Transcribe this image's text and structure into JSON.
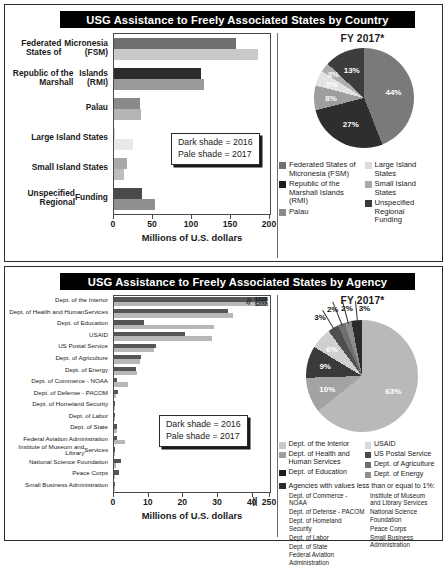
{
  "colors": {
    "dark_fsm": "#6f6f6f",
    "pale_fsm": "#c9c9c9",
    "dark_rmi": "#2b2b2b",
    "pale_rmi": "#9a9a9a",
    "dark_palau": "#8a8a8a",
    "pale_palau": "#b5b5b5",
    "dark_large": "#d5d5d5",
    "pale_large": "#e8e8e8",
    "dark_small": "#a9a9a9",
    "pale_small": "#bdbdbd",
    "dark_unspec": "#4a4a4a",
    "pale_unspec": "#8f8f8f",
    "title_bar_bg": "#000000",
    "title_bar_fg": "#ffffff",
    "panel_border": "#2b2b2b"
  },
  "country_panel": {
    "title": "USG Assistance to Freely Associated States by Country",
    "shade_key": {
      "dark_line": "Dark shade = 2016",
      "pale_line": "Pale shade = 2017"
    },
    "pie_title": "FY 2017*",
    "legend_left": [
      {
        "label": "Federated States of Micronesia (FSM)",
        "color": "#6f6f6f"
      },
      {
        "label": "Republic of the Marshall Islands (RMI)",
        "color": "#1f1f1f"
      },
      {
        "label": "Palau",
        "color": "#8a8a8a"
      }
    ],
    "legend_right": [
      {
        "label": "Large Island States",
        "color": "#dcdcdc"
      },
      {
        "label": "Small Island States",
        "color": "#a9a9a9"
      },
      {
        "label": "Unspecified Regional Funding",
        "color": "#3a3a3a"
      }
    ]
  },
  "agency_panel": {
    "title": "USG Assistance to Freely Associated States by Agency",
    "shade_key": {
      "dark_line": "Dark shade = 2016",
      "pale_line": "Pale shade = 2017"
    },
    "pie_title": "FY 2017*",
    "bar_value_notes": [
      "$203B",
      "$206B"
    ],
    "legend_left": [
      {
        "label": "Dept. of the Interior",
        "color": "#c9c9c9"
      },
      {
        "label": "Dept. of Health and Human Services",
        "color": "#9e9e9e"
      },
      {
        "label": "Dept. of Education",
        "color": "#1f1f1f"
      }
    ],
    "legend_right": [
      {
        "label": "USAID",
        "color": "#d8d8d8"
      },
      {
        "label": "US Postal Service",
        "color": "#4a4a4a"
      },
      {
        "label": "Dept. of Agriculture",
        "color": "#6f6f6f"
      },
      {
        "label": "Dept. of Energy",
        "color": "#8f8f8f"
      }
    ],
    "legend_note": {
      "label": "Agencies with values less than or equal to 1%:",
      "color": "#2b2b2b"
    },
    "sub_left": [
      "Dept. of Commerce - NOAA",
      "Dept. of Defense - PACOM",
      "Dept. of Homeland Security",
      "Dept. of Labor",
      "Dept. of State",
      "Federal Aviation Administration"
    ],
    "sub_right": [
      "Institute of Museum and Library Services",
      "National Science Foundation",
      "Peace Corps",
      "Small Business Administration"
    ]
  },
  "chart_data": [
    {
      "id": "country-bar",
      "type": "bar",
      "orientation": "horizontal",
      "title": "USG Assistance to Freely Associated States by Country",
      "xlabel": "Millions of U.S. dollars",
      "ylabel": "",
      "xlim": [
        0,
        200
      ],
      "xticks": [
        0,
        50,
        100,
        150,
        200
      ],
      "grid": false,
      "categories": [
        "Federated States of Micronesia (FSM)",
        "Republic of the Marshall Islands (RMI)",
        "Palau",
        "Large Island States",
        "Small Island States",
        "Unspecified Regional Funding"
      ],
      "series": [
        {
          "name": "2016",
          "shade": "dark",
          "values": [
            157,
            112,
            33,
            1,
            17,
            36
          ]
        },
        {
          "name": "2017",
          "shade": "pale",
          "values": [
            185,
            116,
            35,
            24,
            13,
            52
          ]
        }
      ]
    },
    {
      "id": "country-pie",
      "type": "pie",
      "title": "FY 2017*",
      "legend_position": "bottom",
      "labels": [
        "Federated States of Micronesia (FSM)",
        "Republic of the Marshall Islands (RMI)",
        "Palau",
        "Large Island States",
        "Small Island States",
        "Unspecified Regional Funding"
      ],
      "values": [
        44,
        27,
        8,
        5,
        3,
        13
      ],
      "display_labels": [
        "44%",
        "27%",
        "8%",
        "5%",
        "3%",
        "13%"
      ]
    },
    {
      "id": "agency-bar",
      "type": "bar",
      "orientation": "horizontal",
      "title": "USG Assistance to Freely Associated States by Agency",
      "xlabel": "Millions of U.S. dollars",
      "ylabel": "",
      "xlim": [
        0,
        45
      ],
      "xticks": [
        0,
        10,
        20,
        30,
        40
      ],
      "axis_break_after": 40,
      "axis_break_label": "250",
      "grid": false,
      "categories": [
        "Dept. of the Interior",
        "Dept. of Health and Human Services",
        "Dept. of Education",
        "USAID",
        "US Postal Service",
        "Dept. of Agriculture",
        "Dept. of Energy",
        "Dept. of Commerce - NOAA",
        "Dept. of Defense - PACOM",
        "Dept. of Homeland Security",
        "Dept. of Labor",
        "Dept. of State",
        "Federal Aviation Administration",
        "Institute of Museum and Library Services",
        "National Science Foundation",
        "Peace Corps",
        "Small Business Administration"
      ],
      "series": [
        {
          "name": "2016",
          "shade": "dark",
          "values": [
            44,
            33,
            8.6,
            20.5,
            12.1,
            7.8,
            6.4,
            0.9,
            1.2,
            0.4,
            0.3,
            1.0,
            0.8,
            0.4,
            1.9,
            1.5,
            0.3
          ]
        },
        {
          "name": "2017",
          "shade": "pale",
          "values": [
            44,
            34.2,
            28.8,
            28.2,
            11.4,
            7.4,
            6.6,
            4.0,
            0.5,
            0.4,
            0.3,
            0.9,
            3.1,
            0.2,
            0.5,
            0.4,
            0.2
          ]
        }
      ]
    },
    {
      "id": "agency-pie",
      "type": "pie",
      "title": "FY 2017*",
      "legend_position": "bottom",
      "labels": [
        "Dept. of the Interior",
        "Dept. of Health and Human Services",
        "Dept. of Education",
        "USAID",
        "US Postal Service",
        "Dept. of Agriculture",
        "Dept. of Energy",
        "Agencies with values less than or equal to 1%"
      ],
      "values": [
        63,
        10,
        9,
        6,
        3,
        2,
        2,
        3
      ],
      "display_labels": [
        "63%",
        "10%",
        "9%",
        "6%",
        "3%",
        "2%",
        "2%",
        "3%"
      ]
    }
  ]
}
